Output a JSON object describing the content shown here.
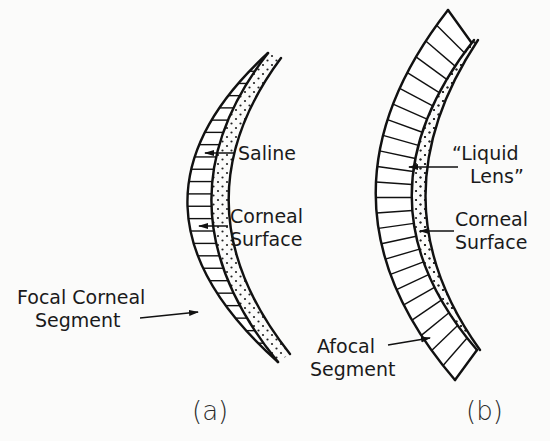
{
  "figure": {
    "panels": [
      {
        "id": "a",
        "caption": "(a)",
        "labels": [
          {
            "text": "Saline",
            "target": "saline-layer"
          },
          {
            "text": "Corneal",
            "text2": "Surface",
            "target": "corneal-surface"
          },
          {
            "text": "Focal Corneal",
            "text2": "Segment",
            "target": "lens-segment"
          }
        ]
      },
      {
        "id": "b",
        "caption": "(b)",
        "labels": [
          {
            "text": "“Liquid",
            "text2": "Lens”",
            "target": "liquid-lens-layer"
          },
          {
            "text": "Corneal",
            "text2": "Surface",
            "target": "corneal-surface"
          },
          {
            "text": "Afocal",
            "text2": "Segment",
            "target": "lens-segment"
          }
        ]
      }
    ],
    "colors": {
      "ink": "#111111",
      "background": "#fbfbfa"
    }
  }
}
